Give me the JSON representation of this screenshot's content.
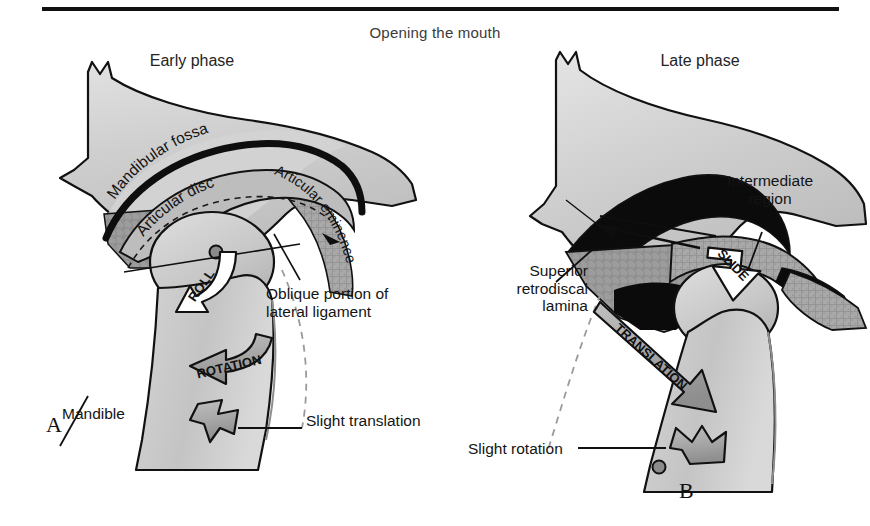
{
  "figure": {
    "title": "Opening the mouth",
    "rule": true
  },
  "panels": [
    {
      "id": "A",
      "letter": "A",
      "phase_title": "Early phase",
      "structure_labels": [
        {
          "name": "mandibular-fossa",
          "text": "Mandibular fossa"
        },
        {
          "name": "articular-disc",
          "text": "Articular disc"
        },
        {
          "name": "articular-eminence",
          "text": "Articular eminence"
        },
        {
          "name": "oblique-portion-lateral-ligament",
          "text": "Oblique portion of\nlateral ligament"
        },
        {
          "name": "mandible",
          "text": "Mandible"
        },
        {
          "name": "slight-translation",
          "text": "Slight translation"
        }
      ],
      "motion_arrows": [
        {
          "name": "roll-arrow",
          "text": "ROLL",
          "style": "white"
        },
        {
          "name": "rotation-arrow",
          "text": "ROTATION",
          "style": "gray"
        },
        {
          "name": "slight-translation-arrow",
          "text": "",
          "style": "gray"
        }
      ]
    },
    {
      "id": "B",
      "letter": "B",
      "phase_title": "Late phase",
      "structure_labels": [
        {
          "name": "superior-retrodiscal-lamina",
          "text": "Superior\nretrodiscal\nlamina"
        },
        {
          "name": "intermediate-region",
          "text": "Intermediate\nregion"
        },
        {
          "name": "slight-rotation",
          "text": "Slight rotation"
        }
      ],
      "motion_arrows": [
        {
          "name": "slide-arrow",
          "text": "SLIDE",
          "style": "white"
        },
        {
          "name": "translation-arrow",
          "text": "TRANSLATION",
          "style": "gray"
        },
        {
          "name": "slight-rotation-arrow",
          "text": "",
          "style": "gray"
        }
      ]
    }
  ],
  "curved_text": {
    "mandibular_fossa": "Mandibular fossa",
    "articular_disc": "Articular disc",
    "articular_eminence": "Articular eminence"
  },
  "arrow_labels": {
    "roll": "ROLL",
    "rotation": "ROTATION",
    "slide": "SLIDE",
    "translation": "TRANSLATION"
  },
  "colors": {
    "bone_fill": "#c9c9c9",
    "bone_fill_light": "#d6d6d6",
    "disc_fill": "#b4b4b4",
    "retrodiscal_fill": "#9a9a9a",
    "joint_space": "#0b0b0b",
    "outline": "#111111",
    "arrow_gray": "#a8a8a8",
    "arrow_white": "#ffffff",
    "text": "#141414",
    "title_text": "#3b3b3b",
    "background": "#ffffff"
  }
}
